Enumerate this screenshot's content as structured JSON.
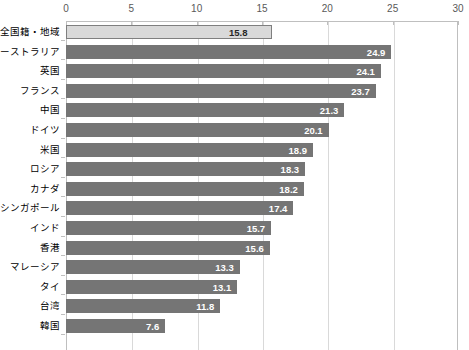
{
  "chart_data": {
    "type": "bar",
    "orientation": "horizontal",
    "title": "",
    "subtitle": "",
    "xlabel": "",
    "ylabel": "",
    "xlim": [
      0,
      30
    ],
    "xticks": [
      0,
      5,
      10,
      15,
      20,
      25,
      30
    ],
    "xtick_labels": [
      "0",
      "5",
      "10",
      "15",
      "20",
      "25",
      "30"
    ],
    "grid": true,
    "legend": null,
    "categories": [
      "全国籍・地域",
      "オーストラリア",
      "英国",
      "フランス",
      "中国",
      "ドイツ",
      "米国",
      "ロシア",
      "カナダ",
      "シンガポール",
      "インド",
      "香港",
      "マレーシア",
      "タイ",
      "台湾",
      "韓国"
    ],
    "values": [
      15.8,
      24.9,
      24.1,
      23.7,
      21.3,
      20.1,
      18.9,
      18.3,
      18.2,
      17.4,
      15.7,
      15.6,
      13.3,
      13.1,
      11.8,
      7.6
    ],
    "value_labels": [
      "15.8",
      "24.9",
      "24.1",
      "23.7",
      "21.3",
      "20.1",
      "18.9",
      "18.3",
      "18.2",
      "17.4",
      "15.7",
      "15.6",
      "13.3",
      "13.1",
      "11.8",
      "7.6"
    ],
    "highlight_index": 0,
    "colors": {
      "bar": "#757575",
      "bar_highlight": "#d9d9d9",
      "bar_highlight_border": "#7f7f7f",
      "gridline": "#d9d9d9",
      "axis": "#bfbfbf",
      "value_label": "#ffffff",
      "value_label_highlight": "#262626",
      "category_label": "#000000",
      "tick_label": "#595959"
    }
  }
}
